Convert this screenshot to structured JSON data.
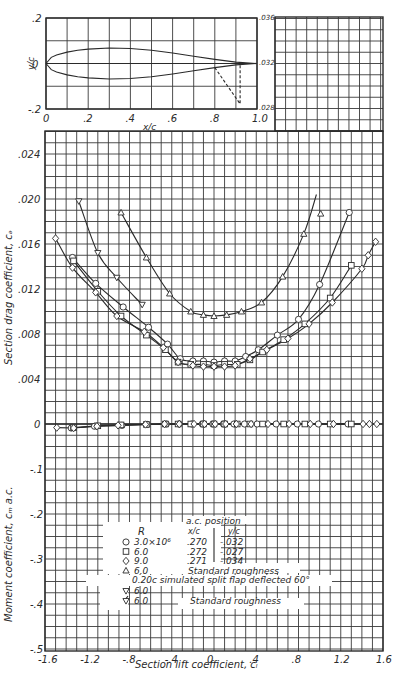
{
  "chart_data": [
    {
      "id": "airfoil-section",
      "type": "line",
      "title": "",
      "xlabel": "x/c",
      "ylabel": "y/c",
      "xlim": [
        0,
        1.0
      ],
      "ylim": [
        -0.2,
        0.2
      ],
      "x_ticks": [
        "0",
        ".2",
        ".4",
        ".6",
        ".8",
        "1.0"
      ],
      "y_ticks": [
        ".2",
        "0",
        "-.2"
      ],
      "grid": true,
      "series": [
        {
          "name": "upper surface",
          "x": [
            0,
            0.025,
            0.05,
            0.1,
            0.15,
            0.2,
            0.3,
            0.4,
            0.5,
            0.6,
            0.7,
            0.8,
            0.9,
            1.0
          ],
          "y": [
            0,
            0.027,
            0.037,
            0.05,
            0.058,
            0.063,
            0.068,
            0.066,
            0.058,
            0.046,
            0.032,
            0.018,
            0.006,
            0
          ]
        },
        {
          "name": "lower surface",
          "x": [
            0,
            0.025,
            0.05,
            0.1,
            0.15,
            0.2,
            0.3,
            0.4,
            0.5,
            0.6,
            0.7,
            0.8,
            0.9,
            1.0
          ],
          "y": [
            0,
            -0.027,
            -0.037,
            -0.05,
            -0.058,
            -0.063,
            -0.068,
            -0.066,
            -0.058,
            -0.046,
            -0.032,
            -0.018,
            -0.006,
            0
          ]
        },
        {
          "name": "simulated split flap (dashed)",
          "x": [
            0.8,
            0.92,
            0.92
          ],
          "y": [
            -0.018,
            -0.178,
            -0.004
          ]
        }
      ]
    },
    {
      "id": "drag-moment-polar",
      "type": "scatter",
      "xlabel": "Section lift coefficient, c_l",
      "ylabel_upper": "Section drag coefficient, c_d",
      "ylabel_lower": "Moment coefficient, c_m a.c.",
      "xlim": [
        -1.6,
        1.6
      ],
      "x_ticks": [
        "-1.6",
        "-1.2",
        "-.8",
        "-.4",
        "0",
        ".4",
        ".8",
        "1.2",
        "1.6"
      ],
      "cd_ticks": [
        ".024",
        ".020",
        ".016",
        ".012",
        ".008",
        ".004",
        "0"
      ],
      "cd_ticks_extra": [
        ".036",
        ".032",
        ".028"
      ],
      "cm_ticks": [
        "-.1",
        "-.2",
        "-.3",
        "-.4",
        "-.5"
      ],
      "grid": true,
      "series": [
        {
          "name": "R 3.0x10^6",
          "marker": "circle",
          "cl": [
            -1.34,
            -1.12,
            -0.86,
            -0.62,
            -0.44,
            -0.32,
            -0.2,
            -0.1,
            0,
            0.1,
            0.2,
            0.3,
            0.42,
            0.6,
            0.8,
            1.0,
            1.28
          ],
          "cd": [
            0.0148,
            0.0125,
            0.0104,
            0.0086,
            0.0071,
            0.0058,
            0.0056,
            0.0056,
            0.0055,
            0.0056,
            0.0056,
            0.006,
            0.0066,
            0.0079,
            0.0093,
            0.0124,
            0.0188
          ],
          "cm": [
            -0.009,
            -0.005,
            -0.003,
            -0.001,
            0,
            0,
            0,
            0,
            0,
            0,
            0,
            0,
            0,
            0,
            0,
            0,
            0
          ]
        },
        {
          "name": "R 6.0",
          "marker": "square",
          "cl": [
            -1.33,
            -1.1,
            -0.88,
            -0.64,
            -0.46,
            -0.34,
            -0.22,
            -0.1,
            0,
            0.1,
            0.22,
            0.34,
            0.46,
            0.66,
            0.86,
            1.1,
            1.3
          ],
          "cd": [
            0.0145,
            0.0118,
            0.0096,
            0.0079,
            0.0066,
            0.0055,
            0.0053,
            0.0053,
            0.0052,
            0.0053,
            0.0053,
            0.0057,
            0.0064,
            0.0075,
            0.0089,
            0.0112,
            0.0141
          ],
          "cm": [
            -0.008,
            -0.004,
            -0.002,
            -0.001,
            0,
            0,
            0,
            0,
            0,
            0,
            0,
            0,
            0,
            0,
            0,
            0,
            0
          ]
        },
        {
          "name": "R 9.0",
          "marker": "diamond",
          "cl": [
            -1.5,
            -1.34,
            -1.12,
            -0.92,
            -0.66,
            -0.48,
            -0.34,
            -0.2,
            -0.1,
            0,
            0.1,
            0.2,
            0.34,
            0.5,
            0.7,
            0.9,
            1.12,
            1.4,
            1.46,
            1.53
          ],
          "cd": [
            0.0165,
            0.0139,
            0.0117,
            0.0096,
            0.0082,
            0.0068,
            0.0055,
            0.0052,
            0.0051,
            0.0051,
            0.0051,
            0.0052,
            0.0058,
            0.0066,
            0.0076,
            0.0089,
            0.0108,
            0.0138,
            0.015,
            0.0162
          ],
          "cm": [
            -0.008,
            -0.009,
            -0.005,
            -0.003,
            -0.001,
            0,
            0,
            0,
            0,
            0,
            0,
            0,
            0,
            0,
            0,
            0,
            0,
            0,
            0,
            0
          ]
        },
        {
          "name": "R 6.0 Standard roughness",
          "marker": "triangle-up",
          "cl": [
            -0.88,
            -0.64,
            -0.42,
            -0.22,
            -0.1,
            0,
            0.12,
            0.26,
            0.45,
            0.65,
            0.85,
            1.01
          ],
          "cd": [
            0.0188,
            0.0148,
            0.0116,
            0.01,
            0.0097,
            0.0096,
            0.0097,
            0.01,
            0.0108,
            0.0131,
            0.0169,
            0.0187
          ],
          "cm": []
        },
        {
          "name": "R 6.0 0.20c simulated split flap deflected 60 deg",
          "marker": "triangle-down",
          "cl": [
            -1.28,
            -1.1,
            -0.92,
            -0.68
          ],
          "cd": [
            0.0198,
            0.0152,
            0.013,
            0.0106
          ],
          "cm": []
        },
        {
          "name": "R 6.0 Standard roughness (flap)",
          "marker": "triangle-down-flagged",
          "cl": [],
          "cd": [],
          "cm": []
        }
      ]
    }
  ],
  "legend": {
    "title_r": "R",
    "title_ac": "a.c. position",
    "col_xc": "x/c",
    "col_yc": "y/c",
    "rows": [
      {
        "marker": "circle",
        "r": "3.0×10⁶",
        "xc": ".270",
        "yc": "-.032"
      },
      {
        "marker": "square",
        "r": "6.0",
        "xc": ".272",
        "yc": "-.027"
      },
      {
        "marker": "diamond",
        "r": "9.0",
        "xc": ".271",
        "yc": "-.034"
      },
      {
        "marker": "triangle-up",
        "r": "6.0",
        "note": "Standard roughness"
      }
    ],
    "flap_note": "0.20c simulated split flap deflected 60°",
    "flap_rows": [
      {
        "marker": "triangle-down",
        "r": "6.0"
      },
      {
        "marker": "triangle-down-flagged",
        "r": "6.0",
        "note": "Standard roughness"
      }
    ]
  }
}
